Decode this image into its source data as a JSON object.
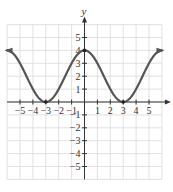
{
  "chart_data": {
    "type": "line",
    "title": "",
    "xlabel": "x",
    "ylabel": "y",
    "xlim": [
      -6,
      6
    ],
    "ylim": [
      -6,
      6
    ],
    "grid": true,
    "x_ticks": [
      -5,
      -4,
      -3,
      -2,
      -1,
      1,
      2,
      3,
      4,
      5
    ],
    "y_ticks": [
      -5,
      -4,
      -3,
      -2,
      -1,
      1,
      2,
      3,
      4,
      5
    ],
    "x_tick_labels": [
      "−5",
      "−4",
      "−3",
      "−2",
      "−1",
      "1",
      "2",
      "3",
      "4",
      "5"
    ],
    "y_tick_labels": [
      "−5",
      "−4",
      "−3",
      "−2",
      "−1",
      "1",
      "2",
      "3",
      "4",
      "5"
    ],
    "series": [
      {
        "name": "curve",
        "description": "smooth periodic-like curve, max at (0,4), touches x-axis at x=-3 and x=3, rising with arrows toward y≈4 at x≈±6",
        "x": [
          -6,
          -5,
          -4,
          -3,
          -2,
          -1,
          0,
          1,
          2,
          3,
          4,
          5,
          6
        ],
        "y": [
          4,
          3,
          1,
          0,
          1,
          3,
          4,
          3,
          1,
          0,
          1,
          3,
          4
        ],
        "arrows_at_ends": true,
        "marked_points": [
          [
            -3,
            0
          ],
          [
            0,
            4
          ],
          [
            3,
            0
          ]
        ]
      }
    ],
    "color": "#555555"
  }
}
